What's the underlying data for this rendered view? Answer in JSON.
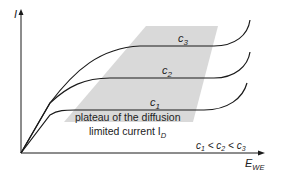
{
  "axes": {
    "y_label": "I",
    "x_label_main": "E",
    "x_label_sub": "WE"
  },
  "curves": [
    {
      "name": "c3",
      "label_main": "c",
      "label_sub": "3"
    },
    {
      "name": "c2",
      "label_main": "c",
      "label_sub": "2"
    },
    {
      "name": "c1",
      "label_main": "c",
      "label_sub": "1"
    }
  ],
  "annotation": {
    "line1": "plateau of the diffusion",
    "line2_main": "limited current I",
    "line2_sub": "D"
  },
  "relation": {
    "c1": "c",
    "c1_sub": "1",
    "lt1": " < ",
    "c2": "c",
    "c2_sub": "2",
    "lt2": " < ",
    "c3": "c",
    "c3_sub": "3"
  },
  "colors": {
    "line": "#1a1a1a",
    "plateau_region": "#d9d9d9",
    "text": "#222222"
  }
}
